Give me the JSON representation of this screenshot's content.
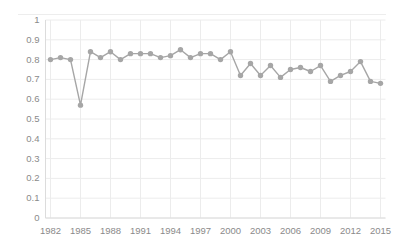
{
  "chart_data": {
    "type": "line",
    "title": "",
    "subtitle": "",
    "xlabel": "",
    "ylabel": "",
    "x": [
      1982,
      1983,
      1984,
      1985,
      1986,
      1987,
      1988,
      1989,
      1990,
      1991,
      1992,
      1993,
      1994,
      1995,
      1996,
      1997,
      1998,
      1999,
      2000,
      2001,
      2002,
      2003,
      2004,
      2005,
      2006,
      2007,
      2008,
      2009,
      2010,
      2011,
      2012,
      2013,
      2014,
      2015
    ],
    "values": [
      0.8,
      0.81,
      0.8,
      0.57,
      0.84,
      0.81,
      0.84,
      0.8,
      0.83,
      0.83,
      0.83,
      0.81,
      0.82,
      0.85,
      0.81,
      0.83,
      0.83,
      0.8,
      0.84,
      0.72,
      0.78,
      0.72,
      0.77,
      0.71,
      0.75,
      0.76,
      0.74,
      0.77,
      0.69,
      0.72,
      0.74,
      0.79,
      0.69,
      0.68
    ],
    "series": [
      {
        "name": "series-1",
        "values": [
          0.8,
          0.81,
          0.8,
          0.57,
          0.84,
          0.81,
          0.84,
          0.8,
          0.83,
          0.83,
          0.83,
          0.81,
          0.82,
          0.85,
          0.81,
          0.83,
          0.83,
          0.8,
          0.84,
          0.72,
          0.78,
          0.72,
          0.77,
          0.71,
          0.75,
          0.76,
          0.74,
          0.77,
          0.69,
          0.72,
          0.74,
          0.79,
          0.69,
          0.68
        ],
        "color": "#a6a6a6",
        "marker": "circle"
      }
    ],
    "xlim": [
      1981.5,
      2015.5
    ],
    "ylim": [
      0,
      1
    ],
    "ytick_values": [
      0,
      0.1,
      0.2,
      0.3,
      0.4,
      0.5,
      0.6,
      0.7,
      0.8,
      0.9,
      1
    ],
    "ytick_labels": [
      "0",
      "0.1",
      "0.2",
      "0.3",
      "0.4",
      "0.5",
      "0.6",
      "0.7",
      "0.8",
      "0.9",
      "1"
    ],
    "xtick_values": [
      1982,
      1985,
      1988,
      1991,
      1994,
      1997,
      2000,
      2003,
      2006,
      2009,
      2012,
      2015
    ],
    "xtick_labels": [
      "1982",
      "1985",
      "1988",
      "1991",
      "1994",
      "1997",
      "2000",
      "2003",
      "2006",
      "2009",
      "2012",
      "2015"
    ],
    "grid": {
      "horizontal": true,
      "vertical": true,
      "color": "#ececec"
    },
    "legend": {
      "visible": false,
      "position": "none"
    },
    "colors": {
      "line": "#a6a6a6",
      "marker": "#a6a6a6",
      "grid": "#ececec",
      "axis_text": "#8a8a8a",
      "background": "#ffffff",
      "top_rule": "#ededed"
    }
  }
}
